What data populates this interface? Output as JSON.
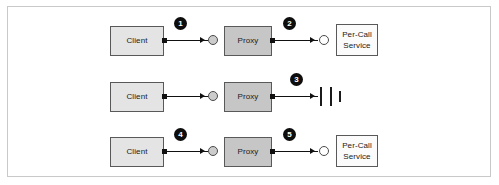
{
  "figure": {
    "background_color": "#ffffff",
    "frame_border_color": "#c9c9c9",
    "line_color": "#111111",
    "badge_color": "#0d0d0d",
    "badge_text_color": "#ffffff"
  },
  "labels": {
    "client": "Client",
    "proxy": "Proxy",
    "service": "Per-Call\nService",
    "service_line1": "Per-Call",
    "service_line2": "Service"
  },
  "rows": [
    {
      "id": "row-1",
      "client_label": "Client",
      "proxy_label": "Proxy",
      "service_label_line1": "Per-Call",
      "service_label_line2": "Service",
      "has_service": true,
      "has_broken_marker": false,
      "left_badge": "1",
      "right_badge": "2",
      "left_socket_fill": "#cccccc",
      "right_socket_fill": "#ffffff"
    },
    {
      "id": "row-2",
      "client_label": "Client",
      "proxy_label": "Proxy",
      "service_label_line1": "",
      "service_label_line2": "",
      "has_service": false,
      "has_broken_marker": true,
      "left_badge": "",
      "right_badge": "3",
      "left_socket_fill": "#cccccc",
      "right_socket_fill": ""
    },
    {
      "id": "row-3",
      "client_label": "Client",
      "proxy_label": "Proxy",
      "service_label_line1": "Per-Call",
      "service_label_line2": "Service",
      "has_service": true,
      "has_broken_marker": false,
      "left_badge": "4",
      "right_badge": "5",
      "left_socket_fill": "#cccccc",
      "right_socket_fill": "#ffffff"
    }
  ],
  "badges": {
    "b1": "1",
    "b2": "2",
    "b3": "3",
    "b4": "4",
    "b5": "5"
  }
}
